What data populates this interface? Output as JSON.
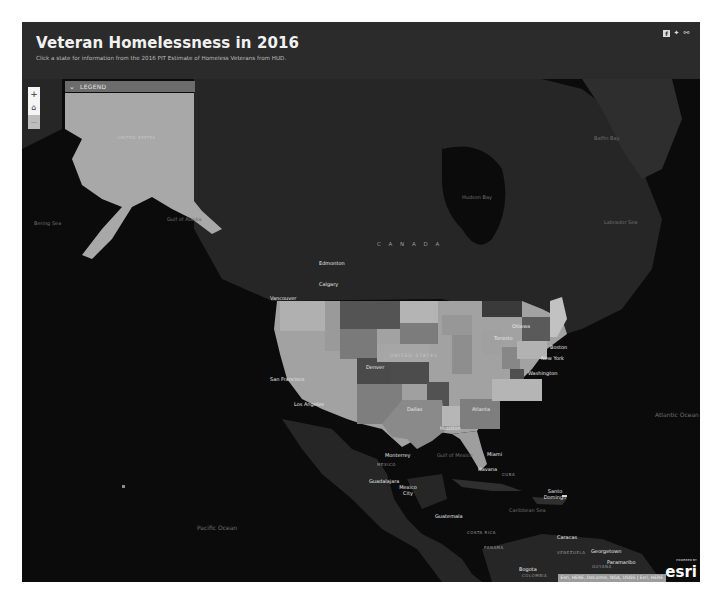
{
  "header": {
    "title": "Veteran Homelessness in 2016",
    "subtitle": "Click a state for information from the 2016 PIT Estimate of Homeless Veterans from HUD.",
    "social": [
      {
        "name": "facebook-icon",
        "glyph": "f"
      },
      {
        "name": "twitter-icon",
        "glyph": "✦"
      },
      {
        "name": "link-icon",
        "glyph": "⚯"
      }
    ]
  },
  "legend": {
    "label": "LEGEND",
    "toggle_icon": "chevron-down-icon",
    "toggle_glyph": "⌄"
  },
  "zoom_controls": {
    "zoom_in": "+",
    "home": "⌂",
    "zoom_out": "−"
  },
  "map_labels": {
    "countries": {
      "canada": "C A N A D A",
      "united_states": "UNITED STATES",
      "alaska_us": "UNITED STATES",
      "mexico": "MEXICO",
      "cuba": "CUBA",
      "venezuela": "VENEZUELA",
      "guyana": "GUYANA",
      "colombia": "COLOMBIA",
      "costa_rica": "COSTA RICA",
      "panama": "PANAMA"
    },
    "cities": {
      "edmonton": "Edmonton",
      "calgary": "Calgary",
      "vancouver": "Vancouver",
      "ottawa": "Ottawa",
      "toronto": "Toronto",
      "boston": "Boston",
      "new_york": "New York",
      "washington": "Washington",
      "san_francisco": "San Francisco",
      "los_angeles": "Los Angeles",
      "denver": "Denver",
      "dallas": "Dallas",
      "houston": "Houston",
      "atlanta": "Atlanta",
      "miami": "Miami",
      "monterrey": "Monterrey",
      "guadalajara": "Guadalajara",
      "mexico_city": "Mexico City",
      "havana": "Havana",
      "santo_domingo": "Santo Domingo",
      "guatemala": "Guatemala",
      "caracas": "Caracas",
      "georgetown": "Georgetown",
      "paramaribo": "Paramaribo",
      "bogota": "Bogota"
    },
    "water": {
      "bering_sea": "Bering Sea",
      "gulf_of_alaska": "Gulf of Alaska",
      "hudson_bay": "Hudson Bay",
      "baffin_bay": "Baffin Bay",
      "labrador_sea": "Labrador Sea",
      "gulf_of_mexico": "Gulf of Mexico",
      "caribbean_sea": "Caribbean Sea",
      "pacific_ocean": "Pacific Ocean",
      "atlantic_ocean": "Atlantic Ocean"
    }
  },
  "attribution": "Esri, HERE, DeLorme, NGA, USGS | Esri, HERE",
  "esri": {
    "powered": "POWERED BY",
    "logo": "esri"
  },
  "colors": {
    "header_bg": "#2b2b2b",
    "ocean": "#0b0b0b",
    "land": "#2a2a2a",
    "state_light": "#a6a6a6",
    "state_mid": "#8a8a8a",
    "state_dark": "#5a5a5a",
    "state_darkest": "#444444",
    "legend_bg": "#6c6c6c"
  }
}
